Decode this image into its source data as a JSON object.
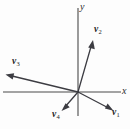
{
  "figure": {
    "type": "vector-diagram",
    "background_color": "#fdfdfd",
    "line_color": "#3c3c42",
    "axis_color": "#4a4a4a",
    "axes": {
      "x_label": "x",
      "y_label": "y",
      "origin": {
        "x": 78,
        "y": 92
      },
      "x_axis": {
        "x1": 3,
        "y1": 92,
        "x2": 121,
        "y2": 92
      },
      "y_axis": {
        "x1": 78,
        "y1": 8,
        "x2": 78,
        "y2": 116
      }
    },
    "vectors": [
      {
        "name": "v1",
        "symbol": "v",
        "subscript": "1",
        "label": "v₁",
        "tip": {
          "x": 113,
          "y": 111
        },
        "label_pos": {
          "x": 113,
          "y": 112
        },
        "components": {
          "x": 35,
          "y": -19
        }
      },
      {
        "name": "v2",
        "symbol": "v",
        "subscript": "2",
        "label": "v₂",
        "tip": {
          "x": 93,
          "y": 41
        },
        "label_pos": {
          "x": 95,
          "y": 28
        },
        "components": {
          "x": 15,
          "y": 51
        }
      },
      {
        "name": "v3",
        "symbol": "v",
        "subscript": "3",
        "label": "v₃",
        "tip": {
          "x": 7,
          "y": 75
        },
        "label_pos": {
          "x": 13,
          "y": 60
        },
        "components": {
          "x": -71,
          "y": 17
        }
      },
      {
        "name": "v4",
        "symbol": "v",
        "subscript": "4",
        "label": "v₄",
        "tip": {
          "x": 62,
          "y": 111
        },
        "label_pos": {
          "x": 54,
          "y": 113
        },
        "components": {
          "x": -16,
          "y": -19
        }
      }
    ]
  }
}
